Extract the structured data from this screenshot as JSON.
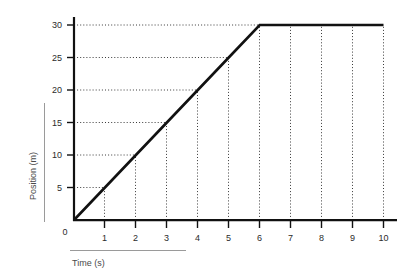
{
  "chart_data": {
    "type": "line",
    "title": "",
    "subtitle": "",
    "xlabel": "Time (s)",
    "ylabel": "Position (m)",
    "xlim": [
      0,
      10
    ],
    "ylim": [
      0,
      30
    ],
    "xticks": [
      0,
      1,
      2,
      3,
      4,
      5,
      6,
      7,
      8,
      9,
      10
    ],
    "xtick_labels": [
      "0",
      "1",
      "2",
      "3",
      "4",
      "5",
      "6",
      "7",
      "8",
      "9",
      "10"
    ],
    "yticks": [
      0,
      5,
      10,
      15,
      20,
      25,
      30
    ],
    "ytick_labels": [
      "0",
      "5",
      "10",
      "15",
      "20",
      "25",
      "30"
    ],
    "grid": "dotted",
    "grid_style": "dotted guide lines drawn from each axis tick to the data curve",
    "legend": "none",
    "legend_position": "none",
    "series": [
      {
        "name": "Position",
        "color": "#111111",
        "x": [
          0,
          1,
          2,
          3,
          4,
          5,
          6,
          7,
          8,
          9,
          10
        ],
        "values": [
          0,
          5,
          10,
          15,
          20,
          25,
          30,
          30,
          30,
          30,
          30
        ]
      }
    ],
    "annotations": []
  },
  "axes": {
    "y_axis_title": "Position (m)",
    "x_axis_title": "Time (s)",
    "y_tick_0": "0",
    "y_tick_5": "5",
    "y_tick_10": "10",
    "y_tick_15": "15",
    "y_tick_20": "20",
    "y_tick_25": "25",
    "y_tick_30": "30",
    "x_tick_0": "0",
    "x_tick_1": "1",
    "x_tick_2": "2",
    "x_tick_3": "3",
    "x_tick_4": "4",
    "x_tick_5": "5",
    "x_tick_6": "6",
    "x_tick_7": "7",
    "x_tick_8": "8",
    "x_tick_9": "9",
    "x_tick_10": "10"
  },
  "colors": {
    "background": "#ffffff",
    "axis": "#111111",
    "data_line": "#111111",
    "grid": "#3a3a3a",
    "tick_text": "#2b2b2b",
    "axis_title_text": "#4a4a4a",
    "rule": "#9a9a9a"
  }
}
